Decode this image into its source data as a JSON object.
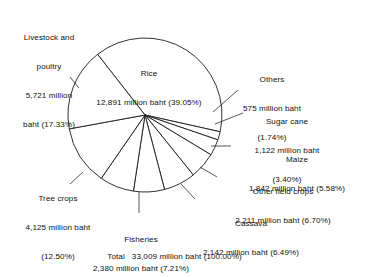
{
  "chart_data": {
    "type": "pie",
    "title": "",
    "unit": "million baht",
    "total_label": "Total",
    "total_value": "33,009",
    "total_percent": "(100.00%)",
    "total_text": "Total    33,009 million baht (100.00%)",
    "legend_position": "callout-labels",
    "categories": [
      "Rice",
      "Others",
      "Sugar cane",
      "Maize",
      "Other field crops",
      "Cassava",
      "Fisheries",
      "Tree crops",
      "Livestock and poultry"
    ],
    "values": [
      12891,
      575,
      1122,
      1842,
      2211,
      2142,
      2380,
      4125,
      5721
    ],
    "percentages": [
      39.05,
      1.74,
      3.4,
      5.58,
      6.7,
      6.49,
      7.21,
      12.5,
      17.33
    ],
    "total": 33009,
    "slices": [
      {
        "name": "Rice",
        "value": "12,891",
        "percent": "(39.05%)",
        "value_pct": 39.05
      },
      {
        "name": "Others",
        "value": "575",
        "percent": "(1.74%)",
        "value_pct": 1.74
      },
      {
        "name": "Sugar cane",
        "value": "1,122",
        "percent": "(3.40%)",
        "value_pct": 3.4
      },
      {
        "name": "Maize",
        "value": "1,842",
        "percent": "(5.58%)",
        "value_pct": 5.58
      },
      {
        "name": "Other field crops",
        "value": "2,211",
        "percent": "(6.70%)",
        "value_pct": 6.7
      },
      {
        "name": "Cassava",
        "value": "2,142",
        "percent": "(6.49%)",
        "value_pct": 6.49
      },
      {
        "name": "Fisheries",
        "value": "2,380",
        "percent": "(7.21%)",
        "value_pct": 7.21
      },
      {
        "name": "Tree crops",
        "value": "4,125",
        "percent": "(12.50%)",
        "value_pct": 12.5
      },
      {
        "name": "Livestock and poultry",
        "value": "5,721",
        "percent": "(17.33%)",
        "value_pct": 17.33
      }
    ],
    "colors": {
      "background": "#ffffff",
      "slice_fill": "#ffffff",
      "slice_stroke": "#1a1a1a",
      "text": "#111111"
    }
  },
  "labels": {
    "livestock": {
      "l1": "Livestock and",
      "l2": "poultry",
      "l3": "5,721 million",
      "l4": "baht (17.33%)"
    },
    "rice": {
      "l1": "Rice",
      "l2": "12,891 million baht (39.05%)"
    },
    "others": {
      "l1": "Others",
      "l2": "575 million baht",
      "l3": "(1.74%)"
    },
    "sugarcane": {
      "l1": "Sugar cane",
      "l2": "1,122 million baht",
      "l3": "(3.40%)"
    },
    "maize": {
      "l1": "Maize",
      "l2": "1,842 million baht (5.58%)"
    },
    "other_field_crops": {
      "l1": "Other field crops",
      "l2": "2,211 million baht (6.70%)"
    },
    "cassava": {
      "l1": "Cassava",
      "l2": "2,142 million baht (6.49%)"
    },
    "fisheries": {
      "l1": "Fisheries",
      "l2": "2,380 million baht (7.21%)"
    },
    "treecrops": {
      "l1": "Tree crops",
      "l2": "4,125 million baht",
      "l3": "(12.50%)"
    },
    "total": {
      "label": "Total",
      "text": "33,009 million baht (100.00%)"
    }
  }
}
